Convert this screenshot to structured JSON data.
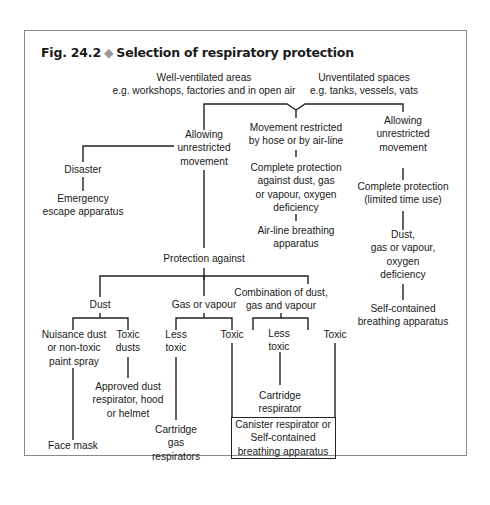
{
  "figure": {
    "number": "Fig. 24.2",
    "separator_glyph": "◆",
    "title": "Selection of respiratory protection"
  },
  "nodes": {
    "well_ventilated": [
      "Well-ventilated areas",
      "e.g. workshops, factories and in open air"
    ],
    "unventilated": [
      "Unventilated spaces",
      "e.g. tanks, vessels, vats"
    ],
    "allowing_left": [
      "Allowing",
      "unrestricted",
      "movement"
    ],
    "restricted": [
      "Movement restricted",
      "by hose or by air-line"
    ],
    "allowing_right": [
      "Allowing",
      "unrestricted",
      "movement"
    ],
    "disaster": [
      "Disaster"
    ],
    "emergency": [
      "Emergency",
      "escape apparatus"
    ],
    "complete_protection_airline": [
      "Complete protection",
      "against dust, gas",
      "or vapour, oxygen",
      "deficiency"
    ],
    "airline_apparatus": [
      "Air-line breathing",
      "apparatus"
    ],
    "complete_protection_limited": [
      "Complete protection",
      "(limited time use)"
    ],
    "dust_gas_oxygen": [
      "Dust,",
      "gas or vapour,",
      "oxygen",
      "deficiency"
    ],
    "self_contained_right": [
      "Self-contained",
      "breathing apparatus"
    ],
    "protection_against": [
      "Protection against"
    ],
    "dust": [
      "Dust"
    ],
    "gas_or_vapour": [
      "Gas or vapour"
    ],
    "combination": [
      "Combination of dust,",
      "gas and vapour"
    ],
    "nuisance_dust": [
      "Nuisance dust",
      "or non-toxic",
      "paint spray"
    ],
    "toxic_dusts": [
      "Toxic",
      "dusts"
    ],
    "gas_less_toxic": [
      "Less",
      "toxic"
    ],
    "gas_toxic": [
      "Toxic"
    ],
    "combo_less_toxic": [
      "Less",
      "toxic"
    ],
    "combo_toxic": [
      "Toxic"
    ],
    "approved_dust": [
      "Approved dust",
      "respirator, hood",
      "or helmet"
    ],
    "face_mask": [
      "Face mask"
    ],
    "cartridge_gas": [
      "Cartridge",
      "gas",
      "respirators"
    ],
    "cartridge_respirator": [
      "Cartridge",
      "respirator"
    ],
    "canister": [
      "Canister respirator or",
      "Self-contained",
      "breathing apparatus"
    ]
  }
}
